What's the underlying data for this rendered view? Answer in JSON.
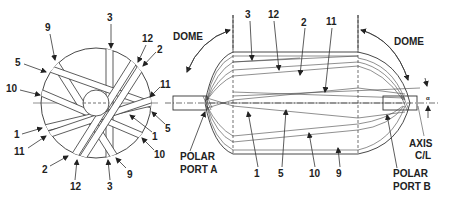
{
  "diagram": {
    "end_view": {
      "band_labels_around": [
        {
          "id": "9",
          "text": "9",
          "pos": "top-left"
        },
        {
          "id": "3",
          "text": "3",
          "pos": "top"
        },
        {
          "id": "12",
          "text": "12",
          "pos": "top-right"
        },
        {
          "id": "2",
          "text": "2",
          "pos": "top-right-2"
        },
        {
          "id": "5",
          "text": "5",
          "pos": "left-upper"
        },
        {
          "id": "10",
          "text": "10",
          "pos": "left"
        },
        {
          "id": "11",
          "text": "11",
          "pos": "right"
        },
        {
          "id": "5b",
          "text": "5",
          "pos": "right-lower"
        },
        {
          "id": "1",
          "text": "1",
          "pos": "left-lower"
        },
        {
          "id": "1b",
          "text": "1",
          "pos": "right-lower-2"
        },
        {
          "id": "11b",
          "text": "11",
          "pos": "left-lower-2"
        },
        {
          "id": "10b",
          "text": "10",
          "pos": "right-bottom"
        },
        {
          "id": "2b",
          "text": "2",
          "pos": "bottom-left"
        },
        {
          "id": "12b",
          "text": "12",
          "pos": "bottom"
        },
        {
          "id": "3b",
          "text": "3",
          "pos": "bottom-center"
        },
        {
          "id": "9b",
          "text": "9",
          "pos": "bottom-right"
        }
      ]
    },
    "side_view": {
      "dome_left": "DOME",
      "dome_right": "DOME",
      "top_labels": [
        "3",
        "12",
        "2",
        "11"
      ],
      "bottom_labels": [
        "1",
        "5",
        "10",
        "9"
      ],
      "polar_port_a": [
        "POLAR",
        "PORT A"
      ],
      "polar_port_b": [
        "POLAR",
        "PORT B"
      ],
      "axis_label": [
        "AXIS",
        "C/L"
      ],
      "angle_symbol": "α"
    }
  }
}
